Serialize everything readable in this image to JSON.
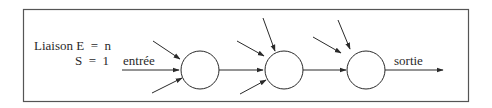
{
  "diagram": {
    "type": "neuron-chain",
    "label_line1": "Liaison E  =  n",
    "label_line2": "S  =  1",
    "input_label": "entrée",
    "output_label": "sortie",
    "nodes": [
      {
        "id": "neuron-1",
        "inputs": 3
      },
      {
        "id": "neuron-2",
        "inputs": 4
      },
      {
        "id": "neuron-3",
        "inputs": 3
      }
    ],
    "colors": {
      "line": "#2a2a2a",
      "border": "#555555",
      "background": "#ffffff"
    }
  }
}
